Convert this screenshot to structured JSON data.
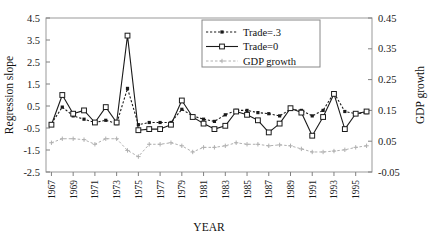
{
  "chart_data": {
    "type": "line",
    "title": "",
    "xlabel": "YEAR",
    "ylabel": "Regression slope",
    "y2label": "GDP growth",
    "grid": false,
    "legend_position": "top-center",
    "ylim": [
      -2.5,
      4.5
    ],
    "ytick_step": 1.0,
    "yticks": [
      "4.5",
      "3.5",
      "2.5",
      "1.5",
      "0.5",
      "-0.5",
      "-1.5",
      "-2.5"
    ],
    "y2lim": [
      -0.05,
      0.45
    ],
    "y2ticks": [
      "0.45",
      "0.35",
      "0.25",
      "0.15",
      "0.05",
      "-0.05"
    ],
    "xlim": [
      1966.5,
      1996.5
    ],
    "x": [
      1967,
      1968,
      1969,
      1970,
      1971,
      1972,
      1973,
      1974,
      1975,
      1976,
      1977,
      1978,
      1979,
      1980,
      1981,
      1982,
      1983,
      1984,
      1985,
      1986,
      1987,
      1988,
      1989,
      1990,
      1991,
      1992,
      1993,
      1994,
      1995,
      1996
    ],
    "xticklabels": [
      "1967",
      "1969",
      "1971",
      "1973",
      "1975",
      "1977",
      "1979",
      "1981",
      "1983",
      "1985",
      "1987",
      "1989",
      "1991",
      "1993",
      "1995"
    ],
    "xtick_values": [
      1967,
      1969,
      1971,
      1973,
      1975,
      1977,
      1979,
      1981,
      1983,
      1985,
      1987,
      1989,
      1991,
      1993,
      1995
    ],
    "series": [
      {
        "name": "Trade=.3",
        "axis": "left",
        "marker": "filled-square",
        "linestyle": "dotted",
        "color": "#1a1a1a",
        "values": [
          -0.3,
          0.45,
          0.05,
          -0.1,
          -0.25,
          -0.15,
          -0.3,
          1.3,
          -0.35,
          -0.25,
          -0.25,
          -0.25,
          0.35,
          0.05,
          -0.1,
          -0.2,
          0.1,
          0.3,
          0.3,
          0.2,
          0.15,
          0.05,
          0.35,
          0.3,
          0.05,
          0.3,
          1.1,
          0.25,
          0.15,
          0.2
        ]
      },
      {
        "name": "Trade=0",
        "axis": "left",
        "marker": "open-square",
        "linestyle": "solid",
        "color": "#1a1a1a",
        "values": [
          -0.35,
          1.0,
          0.15,
          0.3,
          -0.25,
          0.45,
          -0.25,
          3.7,
          -0.6,
          -0.55,
          -0.55,
          -0.35,
          0.75,
          0.0,
          -0.3,
          -0.55,
          -0.4,
          0.25,
          0.1,
          -0.15,
          -0.7,
          -0.3,
          0.4,
          0.2,
          -0.85,
          0.0,
          1.05,
          -0.55,
          0.15,
          0.25
        ]
      },
      {
        "name": "GDP growth",
        "axis": "right",
        "marker": "plus",
        "linestyle": "dotted",
        "color": "#b0b0b0",
        "values": [
          0.045,
          0.058,
          0.058,
          0.055,
          0.04,
          0.058,
          0.058,
          0.02,
          0.0,
          0.04,
          0.04,
          0.045,
          0.035,
          0.015,
          0.03,
          0.03,
          0.035,
          0.045,
          0.04,
          0.04,
          0.035,
          0.038,
          0.035,
          0.025,
          0.015,
          0.015,
          0.018,
          0.022,
          0.03,
          0.035
        ]
      }
    ]
  },
  "legend": {
    "items": [
      {
        "label": "Trade=.3"
      },
      {
        "label": "Trade=0"
      },
      {
        "label": "GDP growth"
      }
    ]
  }
}
